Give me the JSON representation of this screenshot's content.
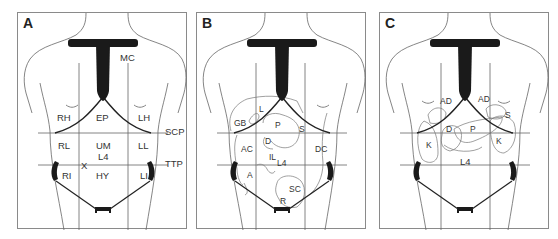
{
  "figure": {
    "panels": [
      {
        "letter": "A",
        "description": "Abdominal regions",
        "labels": {
          "mc": "MC",
          "rh": "RH",
          "ep": "EP",
          "lh": "LH",
          "rl": "RL",
          "um": "UM",
          "l4": "L4",
          "ll": "LL",
          "ri": "RI",
          "hy": "HY",
          "li": "LI",
          "x": "X"
        },
        "plane_labels": {
          "scp": "SCP",
          "ttp": "TTP"
        }
      },
      {
        "letter": "B",
        "description": "Abdominal organs (anterior)",
        "labels": {
          "l": "L",
          "gb": "GB",
          "p": "P",
          "s": "S",
          "d": "D",
          "ac": "AC",
          "il": "IL",
          "l4": "L4",
          "dc": "DC",
          "a": "A",
          "sc": "SC",
          "r": "R"
        }
      },
      {
        "letter": "C",
        "description": "Retroperitoneal organs",
        "labels": {
          "ad_right": "AD",
          "ad_left": "AD",
          "s": "S",
          "d": "D",
          "p": "P",
          "k_right": "K",
          "k_left": "K",
          "l4": "L4"
        }
      }
    ],
    "colors": {
      "frame": "#8a8a8a",
      "outline": "#555555",
      "cartilage": "#1a1a1a",
      "grid": "#666666",
      "text": "#333333"
    }
  }
}
